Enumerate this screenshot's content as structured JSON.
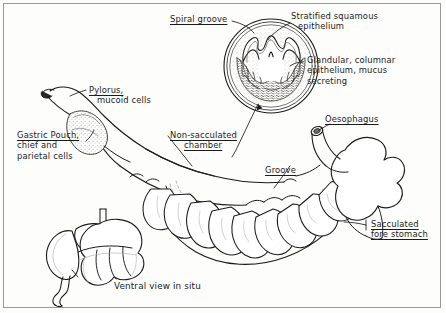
{
  "figure": {
    "caption": "Ventral view in situ",
    "border_color": "#9a9a92",
    "ink_color": "#1b1b1b",
    "background": "#fdfdfb"
  },
  "labels": {
    "spiral_groove": {
      "text": "Spiral groove",
      "underlined": true
    },
    "stratified": {
      "line1": "Stratified squamous",
      "line2": "epithelium",
      "underlined": false
    },
    "glandular": {
      "line1": "Glandular, columnar",
      "line2": "epithelium, mucus",
      "line3": "secreting",
      "underlined": false
    },
    "pylorus": {
      "line1": "Pylorus,",
      "line2": "mucoid cells",
      "underlined_line1": true
    },
    "gastric_pouch": {
      "line1": "Gastric Pouch,",
      "line2": "chief and",
      "line3": "parietal cells",
      "underlined_line1": true
    },
    "non_sacculated": {
      "line1": "Non-sacculated",
      "line2": "chamber",
      "underlined": true
    },
    "oesophagus": {
      "text": "Oesophagus",
      "underlined": true
    },
    "groove": {
      "text": "Groove",
      "underlined": true
    },
    "sacculated": {
      "line1": "Sacculated",
      "line2": "fore stomach",
      "underlined": true
    },
    "ventral_view": {
      "text": "Ventral view in situ",
      "underlined": false
    }
  },
  "diagram": {
    "parts": [
      "cross-section-circle",
      "main-stomach",
      "inset-ventral-view"
    ]
  }
}
